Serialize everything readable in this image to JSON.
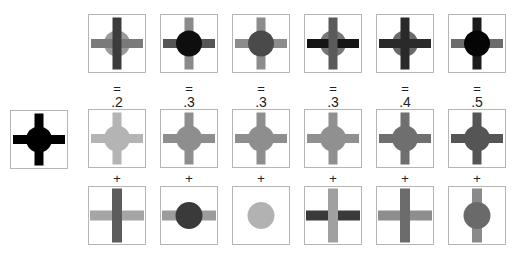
{
  "reference": {
    "label": "reference-stimulus",
    "cross_h": "#000000",
    "cross_v": "#000000",
    "circle": "#000000"
  },
  "columns": [
    {
      "equals": "=",
      "value": ".2",
      "plus": "+",
      "top": {
        "cross_h": "#7a7a7a",
        "cross_v": "#3c3c3c",
        "circle": "#9a9a9a",
        "circle_on_top": false
      },
      "middle": {
        "color": "#b4b4b4"
      },
      "bottom": {
        "cross_h": "#a5a5a5",
        "cross_v": "#5c5c5c",
        "circle": null,
        "circle_on_top": false
      }
    },
    {
      "equals": "=",
      "value": ".3",
      "plus": "+",
      "top": {
        "cross_h": "#555555",
        "cross_v": "#8a8a8a",
        "circle": "#0e0e0e",
        "circle_on_top": true
      },
      "middle": {
        "color": "#8e8e8e"
      },
      "bottom": {
        "cross_h": "#9c9c9c",
        "cross_v": null,
        "circle": "#3a3a3a",
        "circle_on_top": true
      }
    },
    {
      "equals": "=",
      "value": ".3",
      "plus": "+",
      "top": {
        "cross_h": "#8c8c8c",
        "cross_v": "#8c8c8c",
        "circle": "#4a4a4a",
        "circle_on_top": true
      },
      "middle": {
        "color": "#8e8e8e"
      },
      "bottom": {
        "cross_h": null,
        "cross_v": null,
        "circle": "#b2b2b2",
        "circle_on_top": true
      }
    },
    {
      "equals": "=",
      "value": ".3",
      "plus": "+",
      "top": {
        "cross_h": "#151515",
        "cross_v": "#5a5a5a",
        "circle": "#777777",
        "circle_on_top": false
      },
      "middle": {
        "color": "#909090"
      },
      "bottom": {
        "cross_h": "#3a3a3a",
        "cross_v": "#a0a0a0",
        "circle": null,
        "circle_on_top": false
      }
    },
    {
      "equals": "=",
      "value": ".4",
      "plus": "+",
      "top": {
        "cross_h": "#2a2a2a",
        "cross_v": "#2a2a2a",
        "circle": "#6a6a6a",
        "circle_on_top": false
      },
      "middle": {
        "color": "#6f6f6f"
      },
      "bottom": {
        "cross_h": "#8e8e8e",
        "cross_v": "#6c6c6c",
        "circle": null,
        "circle_on_top": false
      }
    },
    {
      "equals": "=",
      "value": ".5",
      "plus": "+",
      "top": {
        "cross_h": "#6c6c6c",
        "cross_v": "#1c1c1c",
        "circle": "#050505",
        "circle_on_top": true
      },
      "middle": {
        "color": "#555555"
      },
      "bottom": {
        "cross_h": null,
        "cross_v": "#8a8a8a",
        "circle": "#6a6a6a",
        "circle_on_top": true
      }
    }
  ],
  "layout": {
    "column_x": [
      88,
      160,
      232,
      304,
      376,
      448
    ],
    "top_y": 14,
    "middle_y": 109,
    "bottom_y": 186,
    "equals_y": 82,
    "value_y": 95,
    "plus_y": 172,
    "reference_x": 10,
    "reference_y": 110
  }
}
